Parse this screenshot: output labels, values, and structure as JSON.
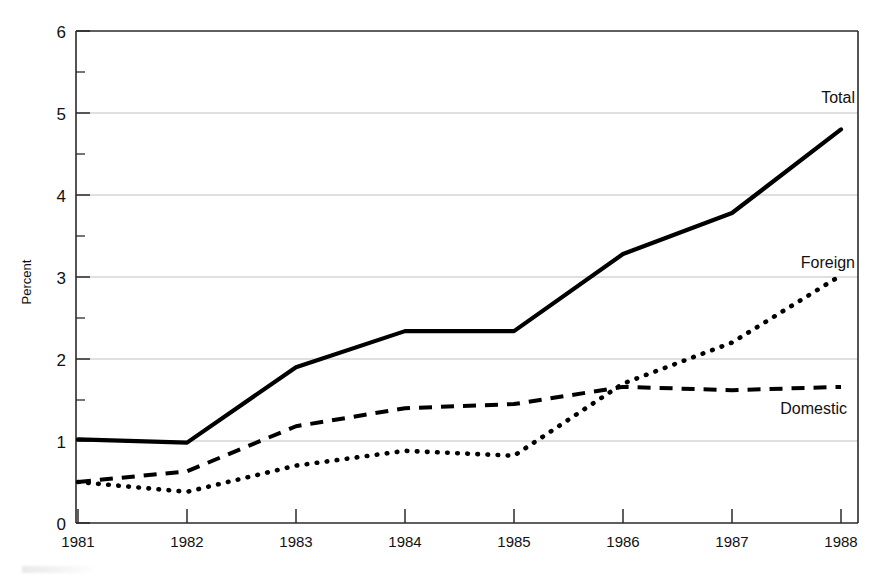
{
  "figure": {
    "background_color": "#ffffff",
    "ink_color": "#000000",
    "grid_color": "#b9b9b9"
  },
  "chart_data": {
    "type": "line",
    "title": "",
    "subtitle": "",
    "xlabel": "",
    "ylabel": "Percent",
    "x": [
      1981,
      1982,
      1983,
      1984,
      1985,
      1986,
      1987,
      1988
    ],
    "categories": [
      "1981",
      "1982",
      "1983",
      "1984",
      "1985",
      "1986",
      "1987",
      "1988"
    ],
    "xlim": [
      1981,
      1988
    ],
    "ylim": [
      0,
      6
    ],
    "yticks": [
      0,
      1,
      2,
      3,
      4,
      5,
      6
    ],
    "ytick_labels": [
      "0",
      "1",
      "2",
      "3",
      "4",
      "5",
      "6"
    ],
    "yticks_minor": [
      0.5,
      1.5,
      2.5,
      3.5,
      4.5,
      5.5
    ],
    "grid": "horizontal-major",
    "legend_position": "inline-right-of-line-ends",
    "series": [
      {
        "name": "Total",
        "style": "solid",
        "label": "Total",
        "values": [
          1.02,
          0.98,
          1.9,
          2.34,
          2.34,
          3.28,
          3.78,
          4.8
        ]
      },
      {
        "name": "Foreign",
        "style": "dotted",
        "label": "Foreign",
        "values": [
          0.5,
          0.38,
          0.7,
          0.88,
          0.82,
          1.7,
          2.2,
          3.02
        ]
      },
      {
        "name": "Domestic",
        "style": "dashed",
        "label": "Domestic",
        "values": [
          0.5,
          0.63,
          1.18,
          1.4,
          1.45,
          1.66,
          1.62,
          1.66
        ]
      }
    ],
    "annotations": [
      {
        "text": "Total",
        "x": 1988,
        "y": 5.3
      },
      {
        "text": "Foreign",
        "x": 1988,
        "y": 3.42
      },
      {
        "text": "Domestic",
        "x": 1987.1,
        "y": 1.28
      }
    ]
  }
}
